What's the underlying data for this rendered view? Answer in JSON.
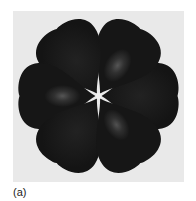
{
  "figure": {
    "label": "(a)",
    "lobe_count": 6,
    "lobe_angles_deg": [
      0,
      60,
      120,
      180,
      240,
      300
    ],
    "colors": {
      "background_panel": "#e9e9e9",
      "lobe_fill": "#161616",
      "lobe_highlight": "#5a5a5a",
      "page": "#ffffff"
    },
    "highlighted_lobes_deg": [
      60,
      180,
      300
    ]
  }
}
